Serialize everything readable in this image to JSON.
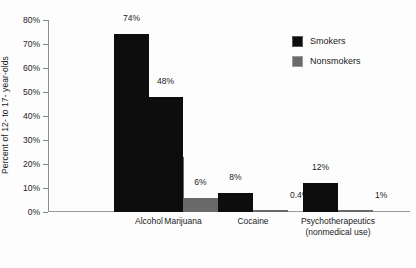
{
  "chart_data": {
    "type": "bar",
    "title": "",
    "subtitle": "",
    "xlabel": "",
    "ylabel": "Percent of 12- to 17- year-olds",
    "ylim": [
      0,
      80
    ],
    "ytick_labels": [
      "80%",
      "70%",
      "60%",
      "50%",
      "40%",
      "30%",
      "20%",
      "10%",
      "0%"
    ],
    "ytick_values": [
      80,
      70,
      60,
      50,
      40,
      30,
      20,
      10,
      0
    ],
    "grid": false,
    "legend_position": "top-right",
    "categories": [
      "Alcohol",
      "Marijuana",
      "Cocaine",
      "Psychotherapeutics"
    ],
    "category_sublabels": [
      "",
      "",
      "",
      "(nonmedical use)"
    ],
    "series": [
      {
        "name": "Smokers",
        "color": "#0d0d0d",
        "values": [
          74,
          48,
          8,
          12
        ],
        "value_labels": [
          "74%",
          "48%",
          "8%",
          "12%"
        ]
      },
      {
        "name": "Nonsmokers",
        "color": "#6a6a6a",
        "values": [
          23,
          6,
          0.4,
          1
        ],
        "value_labels": [
          "23%",
          "6%",
          "0.4%",
          "1%"
        ]
      }
    ]
  },
  "legend": {
    "entries": [
      {
        "label": "Smokers",
        "swatch": "black-square-swatch"
      },
      {
        "label": "Nonsmokers",
        "swatch": "gray-square-swatch"
      }
    ]
  }
}
